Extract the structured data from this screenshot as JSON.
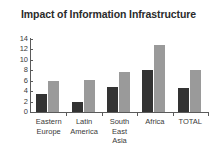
{
  "chart_data": {
    "type": "bar",
    "title": "Impact of Information Infrastructure",
    "xlabel": "",
    "ylabel": "",
    "categories": [
      "Eastern\nEurope",
      "Latin\nAmerica",
      "South\nEast\nAsia",
      "Africa",
      "TOTAL"
    ],
    "series": [
      {
        "name": "series-1",
        "color": "#333333",
        "values": [
          3.5,
          2.0,
          4.8,
          8.1,
          4.6
        ]
      },
      {
        "name": "series-2",
        "color": "#9a9a9a",
        "values": [
          5.9,
          6.1,
          7.6,
          12.8,
          8.1
        ]
      }
    ],
    "ylim": [
      0,
      14
    ],
    "yticks": [
      0,
      2,
      4,
      6,
      8,
      10,
      12,
      14
    ],
    "ytick_labels": [
      "0",
      "2",
      "4",
      "6",
      "8",
      "10",
      "12",
      "14"
    ],
    "grid": false,
    "legend": "none",
    "background": "#ffffff",
    "axis_color": "#5b5b5b",
    "text_color": "#3a3a3a",
    "title_color": "#2b2b2b"
  }
}
